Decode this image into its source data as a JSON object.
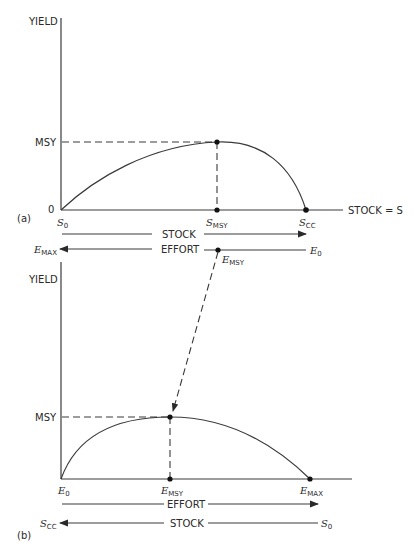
{
  "panel_a": {
    "tag": "(a)",
    "y_axis_label": "YIELD",
    "msy_label": "MSY",
    "zero_label": "0",
    "x_axis_label": "STOCK = S",
    "ticks": {
      "s0": {
        "main": "S",
        "sub": "0"
      },
      "smsy": {
        "main": "S",
        "sub": "MSY"
      },
      "scc": {
        "main": "S",
        "sub": "CC"
      }
    },
    "stock_arrow_label": "STOCK",
    "effort_arrow_label": "EFFORT",
    "effort_left": {
      "main": "E",
      "sub": "MAX"
    },
    "effort_right": {
      "main": "E",
      "sub": "0"
    },
    "effort_msy": {
      "main": "E",
      "sub": "MSY"
    }
  },
  "panel_b": {
    "tag": "(b)",
    "y_axis_label": "YIELD",
    "msy_label": "MSY",
    "ticks": {
      "e0": {
        "main": "E",
        "sub": "0"
      },
      "emsy": {
        "main": "E",
        "sub": "MSY"
      },
      "emax": {
        "main": "E",
        "sub": "MAX"
      }
    },
    "effort_arrow_label": "EFFORT",
    "stock_arrow_label": "STOCK",
    "stock_left": {
      "main": "S",
      "sub": "CC"
    },
    "stock_right": {
      "main": "S",
      "sub": "0"
    }
  },
  "colors": {
    "ink": "#2a2a2a",
    "background": "#ffffff"
  }
}
